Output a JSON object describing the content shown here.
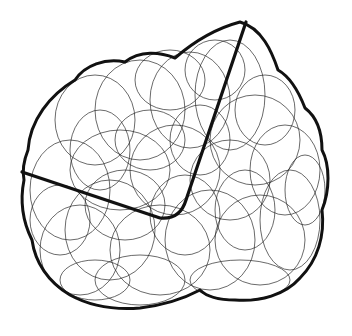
{
  "illustration": {
    "description": "Sketch of many overlapping thin ellipses enclosed by a thick lumpy outline, crossed by a thick bent line",
    "background": "#ffffff",
    "stroke_color": "#111111",
    "outline_path": "M28,150 C30,120 50,95 75,80 C85,65 105,58 125,62 C140,50 160,52 175,58 C190,45 210,30 240,22 C262,28 272,52 278,70 C292,78 300,95 305,108 C318,118 322,132 322,150 C330,165 330,190 322,210 C325,235 318,260 300,278 C285,295 260,302 235,300 C215,300 205,295 200,290 C185,298 165,305 140,308 C115,310 90,306 70,295 C48,282 35,262 32,240 C22,220 20,200 24,180 C22,170 24,160 28,150 Z",
    "bent_line_path": "M22,172 L160,218 Q180,220 186,200 L246,22",
    "ellipses": [
      {
        "cx": 95,
        "cy": 120,
        "rx": 40,
        "ry": 45
      },
      {
        "cx": 140,
        "cy": 110,
        "rx": 45,
        "ry": 50
      },
      {
        "cx": 190,
        "cy": 100,
        "rx": 40,
        "ry": 48
      },
      {
        "cx": 230,
        "cy": 95,
        "rx": 35,
        "ry": 55
      },
      {
        "cx": 255,
        "cy": 140,
        "rx": 45,
        "ry": 45
      },
      {
        "cx": 285,
        "cy": 170,
        "rx": 35,
        "ry": 45
      },
      {
        "cx": 70,
        "cy": 190,
        "rx": 40,
        "ry": 50
      },
      {
        "cx": 110,
        "cy": 230,
        "rx": 45,
        "ry": 50
      },
      {
        "cx": 160,
        "cy": 250,
        "rx": 50,
        "ry": 45
      },
      {
        "cx": 210,
        "cy": 240,
        "rx": 45,
        "ry": 50
      },
      {
        "cx": 260,
        "cy": 240,
        "rx": 45,
        "ry": 45
      },
      {
        "cx": 290,
        "cy": 220,
        "rx": 30,
        "ry": 50
      },
      {
        "cx": 120,
        "cy": 170,
        "rx": 50,
        "ry": 40
      },
      {
        "cx": 175,
        "cy": 170,
        "rx": 45,
        "ry": 45
      },
      {
        "cx": 230,
        "cy": 180,
        "rx": 40,
        "ry": 40
      },
      {
        "cx": 80,
        "cy": 250,
        "rx": 40,
        "ry": 45
      },
      {
        "cx": 140,
        "cy": 280,
        "rx": 45,
        "ry": 25
      },
      {
        "cx": 240,
        "cy": 280,
        "rx": 50,
        "ry": 20
      },
      {
        "cx": 200,
        "cy": 140,
        "rx": 30,
        "ry": 35
      },
      {
        "cx": 150,
        "cy": 140,
        "rx": 35,
        "ry": 30
      },
      {
        "cx": 100,
        "cy": 150,
        "rx": 30,
        "ry": 40
      },
      {
        "cx": 265,
        "cy": 110,
        "rx": 30,
        "ry": 35
      },
      {
        "cx": 215,
        "cy": 70,
        "rx": 30,
        "ry": 30
      },
      {
        "cx": 170,
        "cy": 80,
        "rx": 35,
        "ry": 30
      },
      {
        "cx": 60,
        "cy": 220,
        "rx": 30,
        "ry": 35
      },
      {
        "cx": 185,
        "cy": 215,
        "rx": 35,
        "ry": 40
      },
      {
        "cx": 305,
        "cy": 190,
        "rx": 20,
        "ry": 35
      },
      {
        "cx": 125,
        "cy": 205,
        "rx": 40,
        "ry": 35
      },
      {
        "cx": 245,
        "cy": 210,
        "rx": 30,
        "ry": 40
      },
      {
        "cx": 95,
        "cy": 280,
        "rx": 35,
        "ry": 20
      }
    ]
  }
}
